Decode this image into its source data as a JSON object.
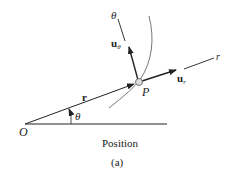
{
  "figure": {
    "caption_title": "Position",
    "caption_label": "(a)"
  },
  "labels": {
    "origin": "O",
    "point": "P",
    "angle": "θ",
    "theta_axis": "θ",
    "r_axis": "r",
    "position_vector": "r",
    "u_theta_main": "u",
    "u_theta_sub": "θ",
    "u_r_main": "u",
    "u_r_sub": "r"
  },
  "colors": {
    "ink": "#222222",
    "curve": "#777777",
    "particle_fill": "#dddddd"
  }
}
